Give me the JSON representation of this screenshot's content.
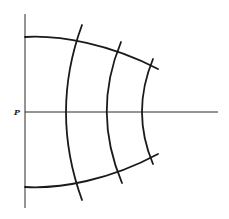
{
  "diagram": {
    "point_label": "P",
    "colors": {
      "stroke": "#1a1a1a",
      "axis": "#2a2a2a",
      "background": "#ffffff"
    },
    "axes": {
      "vertical": {
        "x": 25,
        "y1": 14,
        "y2": 208
      },
      "horizontal": {
        "y": 112,
        "x1": 25,
        "x2": 218
      }
    },
    "boundary_arcs": [
      {
        "name": "top-arc",
        "d": "M25,37 C60,35 110,44 158,69"
      },
      {
        "name": "bottom-arc",
        "d": "M25,187 C60,189 110,180 158,154"
      }
    ],
    "cross_arcs": [
      {
        "name": "cross-arc-1",
        "d": "M82,25 Q50,112 82,200"
      },
      {
        "name": "cross-arc-2",
        "d": "M121,42 Q92,112 122,183"
      },
      {
        "name": "cross-arc-3",
        "d": "M153,59 Q131,112 153,164"
      }
    ]
  }
}
